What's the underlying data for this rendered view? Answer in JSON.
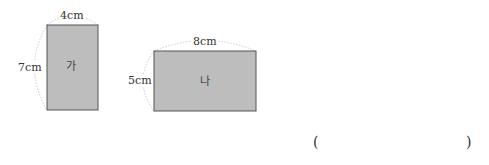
{
  "figure": {
    "shapes": [
      {
        "name": "가",
        "width_label": "4cm",
        "height_label": "7cm",
        "fill": "#bdbdbd",
        "stroke": "#555555"
      },
      {
        "name": "나",
        "width_label": "8cm",
        "height_label": "5cm",
        "fill": "#bdbdbd",
        "stroke": "#555555"
      }
    ],
    "guide_color": "#cccccc"
  },
  "answer": {
    "open_paren": "(",
    "close_paren": ")",
    "value": ""
  }
}
